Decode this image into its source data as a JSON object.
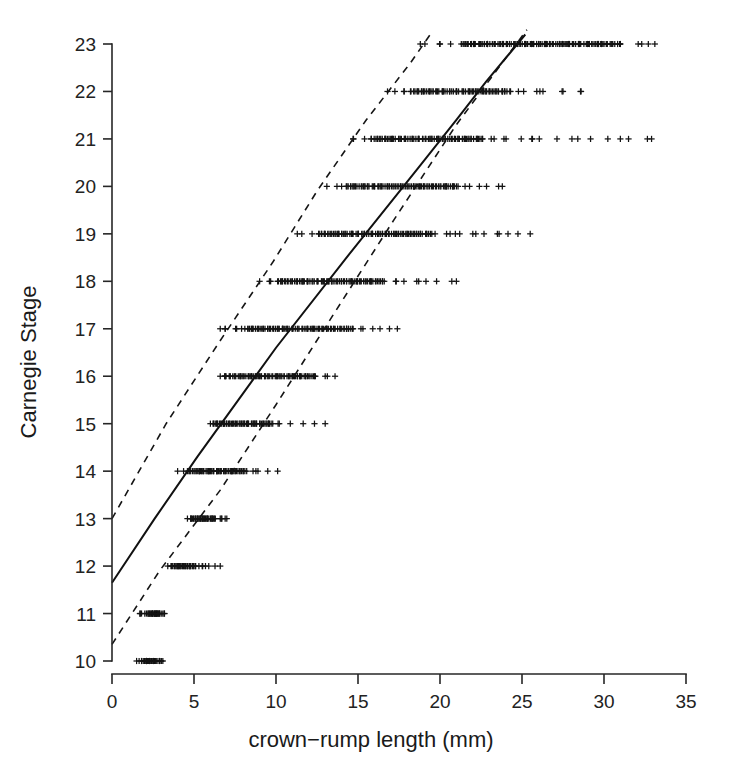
{
  "figure": {
    "title": "",
    "background_color": "#ffffff",
    "ink_color": "#1a1a1a"
  },
  "axes": {
    "x_title": "crown−rump length (mm)",
    "y_title": "Carnegie Stage",
    "x_ticks": [
      "0",
      "5",
      "10",
      "15",
      "20",
      "25",
      "30",
      "35"
    ],
    "y_ticks": [
      "10",
      "11",
      "12",
      "13",
      "14",
      "15",
      "16",
      "17",
      "18",
      "19",
      "20",
      "21",
      "22",
      "23"
    ]
  },
  "chart_data": {
    "type": "scatter",
    "title": "",
    "xlabel": "crown−rump length (mm)",
    "ylabel": "Carnegie Stage",
    "xlim": [
      0,
      35
    ],
    "ylim": [
      9.6,
      23.5
    ],
    "xticks": [
      0,
      5,
      10,
      15,
      20,
      25,
      30,
      35
    ],
    "yticks": [
      10,
      11,
      12,
      13,
      14,
      15,
      16,
      17,
      18,
      19,
      20,
      21,
      22,
      23
    ],
    "grid": false,
    "legend": "none",
    "marker": "plus",
    "series": [
      {
        "name": "observations",
        "note": "Carnegie stage (y, integer) versus crown-rump length in mm (x). Points are jittered only in x; each stage forms a horizontal band.",
        "stages": [
          {
            "stage": 10,
            "x_range": [
              1.5,
              3.1
            ],
            "x_dense_core": [
              1.9,
              2.7
            ],
            "x": [
              1.5,
              1.8,
              1.9,
              2.0,
              2.0,
              2.1,
              2.1,
              2.2,
              2.2,
              2.2,
              2.3,
              2.3,
              2.3,
              2.4,
              2.4,
              2.5,
              2.5,
              2.6,
              2.7,
              2.8,
              2.9,
              3.0,
              3.1
            ]
          },
          {
            "stage": 11,
            "x_range": [
              1.7,
              3.2
            ],
            "x_dense_core": [
              2.2,
              2.9
            ],
            "x": [
              1.7,
              1.8,
              2.0,
              2.1,
              2.2,
              2.3,
              2.4,
              2.5,
              2.5,
              2.6,
              2.6,
              2.7,
              2.7,
              2.7,
              2.8,
              2.8,
              2.9,
              2.9,
              3.0,
              3.1,
              3.2
            ]
          },
          {
            "stage": 12,
            "x_range": [
              3.4,
              6.6
            ],
            "x_dense_core": [
              3.6,
              5.1
            ],
            "x": [
              3.4,
              3.6,
              3.7,
              3.8,
              3.9,
              4.0,
              4.0,
              4.1,
              4.2,
              4.2,
              4.3,
              4.4,
              4.4,
              4.5,
              4.6,
              4.6,
              4.7,
              4.8,
              4.9,
              5.0,
              5.1,
              5.3,
              5.5,
              5.7,
              5.9,
              6.6
            ]
          },
          {
            "stage": 13,
            "x_range": [
              4.6,
              7.0
            ],
            "x_dense_core": [
              4.8,
              6.3
            ],
            "x": [
              4.6,
              4.8,
              4.9,
              5.0,
              5.1,
              5.2,
              5.2,
              5.3,
              5.4,
              5.4,
              5.5,
              5.6,
              5.6,
              5.7,
              5.8,
              5.8,
              5.9,
              6.0,
              6.1,
              6.2,
              6.3,
              6.6,
              6.7,
              6.9,
              7.0
            ]
          },
          {
            "stage": 14,
            "x_range": [
              4.0,
              10.1
            ],
            "x_dense_core": [
              4.6,
              8.1
            ],
            "x": [
              4.0,
              4.6,
              4.8,
              5.0,
              5.2,
              5.4,
              5.5,
              5.6,
              5.8,
              5.9,
              6.0,
              6.1,
              6.2,
              6.4,
              6.5,
              6.6,
              6.8,
              6.9,
              7.0,
              7.2,
              7.3,
              7.5,
              7.6,
              7.8,
              8.0,
              8.1,
              8.6,
              8.9,
              10.1
            ]
          },
          {
            "stage": 15,
            "x_range": [
              6.0,
              13.0
            ],
            "x_dense_core": [
              6.1,
              9.8
            ],
            "x": [
              6.0,
              6.2,
              6.4,
              6.6,
              6.8,
              7.0,
              7.1,
              7.2,
              7.4,
              7.5,
              7.6,
              7.8,
              7.9,
              8.0,
              8.2,
              8.3,
              8.5,
              8.6,
              8.8,
              9.0,
              9.2,
              9.4,
              9.6,
              9.8,
              10.2,
              13.0
            ]
          },
          {
            "stage": 16,
            "x_range": [
              6.6,
              13.6
            ],
            "x_dense_core": [
              6.8,
              12.4
            ],
            "x": [
              6.6,
              6.9,
              7.2,
              7.5,
              7.8,
              8.0,
              8.3,
              8.5,
              8.8,
              9.0,
              9.3,
              9.5,
              9.8,
              10.0,
              10.3,
              10.5,
              10.8,
              11.0,
              11.3,
              11.5,
              11.8,
              12.0,
              12.4,
              13.0,
              13.6
            ]
          },
          {
            "stage": 17,
            "x_range": [
              6.6,
              17.4
            ],
            "x_dense_core": [
              8.2,
              14.7
            ],
            "x": [
              6.6,
              6.9,
              7.6,
              7.9,
              8.1,
              8.3,
              8.6,
              8.9,
              9.2,
              9.5,
              9.8,
              10.1,
              10.4,
              10.7,
              11.0,
              11.3,
              11.6,
              11.9,
              12.2,
              12.5,
              12.8,
              13.1,
              13.5,
              13.9,
              14.3,
              14.7,
              15.3,
              15.9,
              17.4
            ]
          },
          {
            "stage": 18,
            "x_range": [
              9.0,
              21.0
            ],
            "x_dense_core": [
              10.1,
              16.6
            ],
            "x": [
              9.0,
              9.6,
              10.1,
              10.4,
              10.7,
              11.0,
              11.3,
              11.6,
              11.9,
              12.2,
              12.5,
              12.8,
              13.1,
              13.4,
              13.7,
              14.0,
              14.3,
              14.6,
              14.9,
              15.2,
              15.5,
              15.8,
              16.1,
              16.6,
              17.3,
              17.8,
              18.7,
              21.0
            ]
          },
          {
            "stage": 19,
            "x_range": [
              11.3,
              25.5
            ],
            "x_dense_core": [
              12.6,
              19.5
            ],
            "x": [
              11.3,
              12.2,
              12.6,
              13.0,
              13.4,
              13.8,
              14.2,
              14.6,
              15.0,
              15.4,
              15.8,
              16.2,
              16.5,
              16.9,
              17.3,
              17.7,
              18.0,
              18.4,
              18.8,
              19.2,
              19.5,
              20.4,
              21.2,
              22.0,
              23.5,
              25.5
            ]
          },
          {
            "stage": 20,
            "x_range": [
              13.1,
              23.8
            ],
            "x_dense_core": [
              14.2,
              21.1
            ],
            "x": [
              13.1,
              14.0,
              14.4,
              14.8,
              15.2,
              15.6,
              16.0,
              16.4,
              16.8,
              17.2,
              17.6,
              18.0,
              18.4,
              18.8,
              19.2,
              19.6,
              20.0,
              20.4,
              20.8,
              21.1,
              21.8,
              22.4,
              23.8
            ]
          },
          {
            "stage": 21,
            "x_range": [
              14.7,
              32.9
            ],
            "x_dense_core": [
              15.8,
              22.6
            ],
            "x": [
              14.7,
              15.4,
              15.8,
              16.3,
              16.7,
              17.1,
              17.5,
              17.9,
              18.3,
              18.7,
              19.1,
              19.5,
              19.9,
              20.3,
              20.7,
              21.1,
              21.5,
              21.9,
              22.3,
              22.6,
              23.3,
              23.9,
              25.6,
              32.9
            ]
          },
          {
            "stage": 22,
            "x_range": [
              16.8,
              28.6
            ],
            "x_dense_core": [
              18.2,
              24.3
            ],
            "x": [
              16.8,
              17.8,
              18.2,
              18.6,
              19.0,
              19.4,
              19.8,
              20.2,
              20.6,
              21.0,
              21.4,
              21.8,
              22.2,
              22.6,
              23.0,
              23.4,
              23.8,
              24.3,
              25.1,
              25.9,
              27.5,
              28.6
            ]
          },
          {
            "stage": 23,
            "x_range": [
              18.8,
              33.1
            ],
            "x_dense_core": [
              21.3,
              31.0
            ],
            "x": [
              18.8,
              20.0,
              21.3,
              21.7,
              22.1,
              22.5,
              22.9,
              23.3,
              23.7,
              24.1,
              24.5,
              24.9,
              25.3,
              25.7,
              26.1,
              26.5,
              26.9,
              27.3,
              27.7,
              28.1,
              28.5,
              29.0,
              29.5,
              30.0,
              30.5,
              31.0,
              32.3,
              33.1
            ]
          }
        ]
      }
    ],
    "lines": [
      {
        "name": "fitted-regression",
        "style": "solid",
        "points": [
          [
            0.0,
            11.65
          ],
          [
            2.6,
            13.0
          ],
          [
            5.2,
            14.3
          ],
          [
            10.0,
            16.6
          ],
          [
            14.3,
            18.5
          ],
          [
            18.7,
            20.4
          ],
          [
            21.0,
            21.4
          ],
          [
            22.8,
            22.2
          ],
          [
            25.2,
            23.2
          ]
        ]
      },
      {
        "name": "upper-confidence-bound",
        "style": "dashed",
        "points": [
          [
            0.0,
            13.0
          ],
          [
            3.3,
            15.0
          ],
          [
            6.5,
            16.7
          ],
          [
            9.8,
            18.4
          ],
          [
            12.5,
            19.9
          ],
          [
            15.5,
            21.4
          ],
          [
            18.2,
            22.6
          ],
          [
            19.4,
            23.2
          ]
        ]
      },
      {
        "name": "lower-confidence-bound",
        "style": "dashed",
        "points": [
          [
            0.0,
            10.35
          ],
          [
            2.9,
            11.9
          ],
          [
            6.6,
            13.6
          ],
          [
            10.0,
            15.4
          ],
          [
            13.5,
            17.3
          ],
          [
            17.2,
            19.3
          ],
          [
            21.0,
            21.3
          ],
          [
            24.0,
            22.7
          ],
          [
            25.3,
            23.3
          ]
        ]
      }
    ]
  }
}
